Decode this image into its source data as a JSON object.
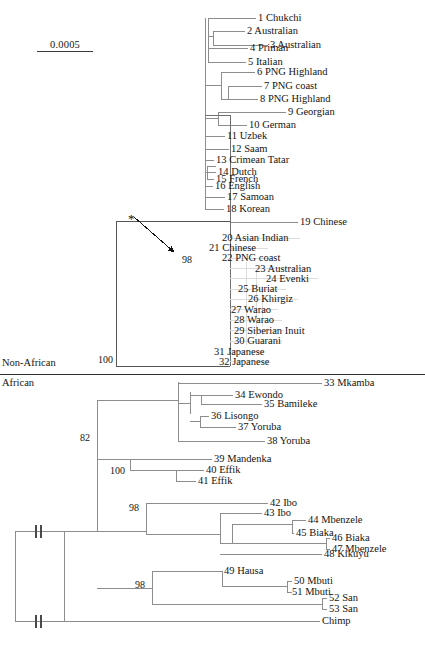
{
  "figure": {
    "type": "phylogenetic-tree",
    "title": "",
    "scale_bar": {
      "label": "0.0005",
      "units": "substitutions per site"
    },
    "asterisk": {
      "glyph": "*",
      "meaning_marker": "node-pointer"
    },
    "group_labels": [
      {
        "id": "non-african",
        "text": "Non-African"
      },
      {
        "id": "african",
        "text": "African"
      }
    ],
    "bootstrap_values": [
      {
        "id": "boot-98-nonafrican",
        "value": "98"
      },
      {
        "id": "boot-100-root-split",
        "value": "100"
      },
      {
        "id": "boot-82-african",
        "value": "82"
      },
      {
        "id": "boot-100-mandenka",
        "value": "100"
      },
      {
        "id": "boot-98-ibo",
        "value": "98"
      },
      {
        "id": "boot-98-hausa",
        "value": "98"
      }
    ],
    "outgroup": {
      "label": "Chimp"
    },
    "leaves": [
      {
        "n": "1",
        "name": "Chukchi"
      },
      {
        "n": "2",
        "name": "Australian"
      },
      {
        "n": "3",
        "name": "Australian"
      },
      {
        "n": "4",
        "name": "Priman"
      },
      {
        "n": "5",
        "name": "Italian"
      },
      {
        "n": "6",
        "name": "PNG Highland"
      },
      {
        "n": "7",
        "name": "PNG coast"
      },
      {
        "n": "8",
        "name": "PNG Highland"
      },
      {
        "n": "9",
        "name": "Georgian"
      },
      {
        "n": "10",
        "name": "German"
      },
      {
        "n": "11",
        "name": "Uzbek"
      },
      {
        "n": "12",
        "name": "Saam"
      },
      {
        "n": "13",
        "name": "Crimean Tatar"
      },
      {
        "n": "14",
        "name": "Dutch"
      },
      {
        "n": "15",
        "name": "French"
      },
      {
        "n": "16",
        "name": "English"
      },
      {
        "n": "17",
        "name": "Samoan"
      },
      {
        "n": "18",
        "name": "Korean"
      },
      {
        "n": "19",
        "name": "Chinese"
      },
      {
        "n": "20",
        "name": "Asian Indian"
      },
      {
        "n": "21",
        "name": "Chinese"
      },
      {
        "n": "22",
        "name": "PNG coast"
      },
      {
        "n": "23",
        "name": "Australian"
      },
      {
        "n": "24",
        "name": "Evenki"
      },
      {
        "n": "25",
        "name": "Buriat"
      },
      {
        "n": "26",
        "name": "Khirgiz"
      },
      {
        "n": "27",
        "name": "Warao"
      },
      {
        "n": "28",
        "name": "Warao"
      },
      {
        "n": "29",
        "name": "Siberian Inuit"
      },
      {
        "n": "30",
        "name": "Guarani"
      },
      {
        "n": "31",
        "name": "Japanese"
      },
      {
        "n": "32",
        "name": "Japanese"
      },
      {
        "n": "33",
        "name": "Mkamba"
      },
      {
        "n": "34",
        "name": "Ewondo"
      },
      {
        "n": "35",
        "name": "Bamileke"
      },
      {
        "n": "36",
        "name": "Lisongo"
      },
      {
        "n": "37",
        "name": "Yoruba"
      },
      {
        "n": "38",
        "name": "Yoruba"
      },
      {
        "n": "39",
        "name": "Mandenka"
      },
      {
        "n": "40",
        "name": "Effik"
      },
      {
        "n": "41",
        "name": "Effik"
      },
      {
        "n": "42",
        "name": "Ibo"
      },
      {
        "n": "43",
        "name": "Ibo"
      },
      {
        "n": "44",
        "name": "Mbenzele"
      },
      {
        "n": "45",
        "name": "Biaka"
      },
      {
        "n": "46",
        "name": "Biaka"
      },
      {
        "n": "47",
        "name": "Mbenzele"
      },
      {
        "n": "48",
        "name": "Kikuyu"
      },
      {
        "n": "49",
        "name": "Hausa"
      },
      {
        "n": "50",
        "name": "Mbuti"
      },
      {
        "n": "51",
        "name": "Mbuti"
      },
      {
        "n": "52",
        "name": "San"
      },
      {
        "n": "53",
        "name": "San"
      }
    ],
    "colors": {
      "line": "#8d8d8d",
      "line_faint": "#d6d6d6",
      "line_dark": "#4a4a4a",
      "text": "#141414",
      "background": "#ffffff"
    }
  }
}
